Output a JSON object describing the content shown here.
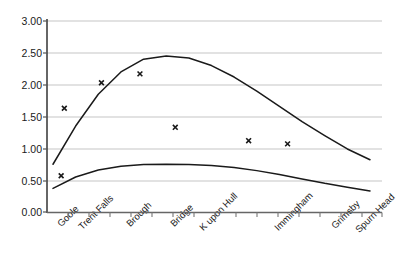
{
  "chart_data": {
    "type": "line",
    "title": "",
    "xlabel": "",
    "ylabel": "",
    "categories": [
      "Goole",
      "Trent Falls",
      "Brough",
      "Bridge",
      "K upon Hull",
      "Immingham",
      "Grimsby",
      "Spurn Head"
    ],
    "ylim": [
      0.0,
      3.0
    ],
    "ytick_labels": [
      "0.00",
      "0.50",
      "1.00",
      "1.50",
      "2.00",
      "2.50",
      "3.00"
    ],
    "ytick_values": [
      0.0,
      0.5,
      1.0,
      1.5,
      2.0,
      2.5,
      3.0
    ],
    "grid": true,
    "grid_axis": "y",
    "legend": "none",
    "series": [
      {
        "name": "upper-curve",
        "style": "line",
        "color": "#1a1a1a",
        "x": [
          0.0,
          0.5,
          1.0,
          1.5,
          2.0,
          2.5,
          3.0,
          3.5,
          4.0,
          4.5,
          5.0,
          5.5,
          6.0,
          6.5,
          7.0
        ],
        "values": [
          0.75,
          1.35,
          1.85,
          2.2,
          2.4,
          2.45,
          2.42,
          2.3,
          2.12,
          1.9,
          1.66,
          1.42,
          1.2,
          0.99,
          0.82
        ]
      },
      {
        "name": "lower-curve",
        "style": "line",
        "color": "#1a1a1a",
        "x": [
          0.0,
          0.5,
          1.0,
          1.5,
          2.0,
          2.5,
          3.0,
          3.5,
          4.0,
          4.5,
          5.0,
          5.5,
          6.0,
          6.5,
          7.0
        ],
        "values": [
          0.37,
          0.55,
          0.66,
          0.72,
          0.745,
          0.75,
          0.745,
          0.73,
          0.7,
          0.65,
          0.59,
          0.52,
          0.45,
          0.39,
          0.33
        ]
      },
      {
        "name": "observed-points",
        "style": "marker",
        "marker": "x",
        "color": "#1a1a1a",
        "points": [
          {
            "x": 0.18,
            "y": 0.57
          },
          {
            "x": 0.25,
            "y": 1.63
          },
          {
            "x": 1.07,
            "y": 2.03
          },
          {
            "x": 1.92,
            "y": 2.17
          },
          {
            "x": 2.7,
            "y": 1.33
          },
          {
            "x": 4.32,
            "y": 1.12
          },
          {
            "x": 5.18,
            "y": 1.07
          }
        ]
      }
    ]
  },
  "axes": {
    "x_axis_color": "#555555",
    "y_axis_color": "#333333",
    "grid_color": "#d9d9d9"
  }
}
